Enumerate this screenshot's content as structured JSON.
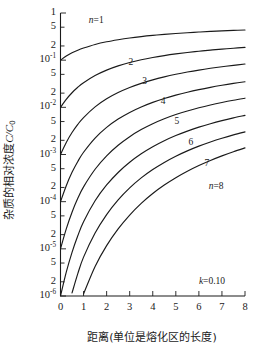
{
  "chart_data": {
    "type": "line",
    "title": "",
    "xlabel": "距离(单位是熔化区的长度)",
    "ylabel": "杂质的相对浓度C/C₀",
    "ylabel_parts": {
      "text": "杂质的相对浓度",
      "italic": "C/C",
      "sub": "0"
    },
    "annotation": {
      "text": "k=0.10",
      "italic": "k",
      "rest": "=0.10"
    },
    "xlim": [
      0,
      8
    ],
    "ylim": [
      1e-06,
      1
    ],
    "yscale": "log",
    "grid": false,
    "legend": "inline-curve-labels",
    "xticks": [
      0,
      1,
      2,
      3,
      4,
      5,
      6,
      7,
      8
    ],
    "xtick_labels": [
      "0",
      "1",
      "2",
      "3",
      "4",
      "5",
      "6",
      "7",
      "8"
    ],
    "ytick_labels": [
      {
        "mant": "1",
        "exp": ""
      },
      {
        "mant": "5",
        "exp": ""
      },
      {
        "mant": "2",
        "exp": ""
      },
      {
        "mant": "10",
        "exp": "-1"
      },
      {
        "mant": "5",
        "exp": ""
      },
      {
        "mant": "2",
        "exp": ""
      },
      {
        "mant": "10",
        "exp": "-2"
      },
      {
        "mant": "5",
        "exp": ""
      },
      {
        "mant": "2",
        "exp": ""
      },
      {
        "mant": "10",
        "exp": "-3"
      },
      {
        "mant": "5",
        "exp": ""
      },
      {
        "mant": "2",
        "exp": ""
      },
      {
        "mant": "10",
        "exp": "-4"
      },
      {
        "mant": "5",
        "exp": ""
      },
      {
        "mant": "2",
        "exp": ""
      },
      {
        "mant": "10",
        "exp": "-5"
      },
      {
        "mant": "5",
        "exp": ""
      },
      {
        "mant": "2",
        "exp": ""
      },
      {
        "mant": "10",
        "exp": "-6"
      }
    ],
    "ytick_values": [
      1,
      0.5,
      0.2,
      0.1,
      0.05,
      0.02,
      0.01,
      0.005,
      0.002,
      0.001,
      0.0005,
      0.0002,
      0.0001,
      5e-05,
      2e-05,
      1e-05,
      5e-06,
      2e-06,
      1e-06
    ],
    "x": [
      0,
      0.25,
      0.5,
      0.75,
      1,
      1.5,
      2,
      2.5,
      3,
      3.5,
      4,
      4.5,
      5,
      5.5,
      6,
      6.5,
      7,
      7.5,
      8
    ],
    "series": [
      {
        "name": "n=1",
        "label": "n=1",
        "label_x": 1.55,
        "label_y": 0.6,
        "values": [
          0.1,
          0.122,
          0.143,
          0.163,
          0.181,
          0.215,
          0.245,
          0.271,
          0.295,
          0.316,
          0.335,
          0.352,
          0.368,
          0.382,
          0.395,
          0.407,
          0.418,
          0.428,
          0.437
        ]
      },
      {
        "name": "n=2",
        "label": "2",
        "label_x": 3.05,
        "label_y": 0.078,
        "values": [
          0.01,
          0.0148,
          0.0204,
          0.0266,
          0.0332,
          0.0472,
          0.0615,
          0.0755,
          0.089,
          0.1018,
          0.1138,
          0.1251,
          0.1357,
          0.1455,
          0.1548,
          0.1634,
          0.1715,
          0.1791,
          0.1862
        ]
      },
      {
        "name": "n=3",
        "label": "3",
        "label_x": 3.65,
        "label_y": 0.0305,
        "values": [
          0.001,
          0.0018,
          0.00292,
          0.00435,
          0.00608,
          0.01025,
          0.01518,
          0.0206,
          0.02634,
          0.03226,
          0.03825,
          0.04424,
          0.05018,
          0.056,
          0.0617,
          0.06724,
          0.0726,
          0.0778,
          0.0828
        ]
      },
      {
        "name": "n=4",
        "label": "4",
        "label_x": 4.45,
        "label_y": 0.0118,
        "values": [
          0.0001,
          0.000218,
          0.000418,
          0.000712,
          0.001115,
          0.00223,
          0.00376,
          0.00564,
          0.0078,
          0.01018,
          0.01273,
          0.0154,
          0.01815,
          0.02094,
          0.02376,
          0.02658,
          0.02938,
          0.03214,
          0.03484
        ]
      },
      {
        "name": "n=5",
        "label": "5",
        "label_x": 5.05,
        "label_y": 0.00445,
        "values": [
          1e-05,
          2.65e-05,
          5.98e-05,
          0.0001175,
          0.000206,
          0.000486,
          0.000935,
          0.00157,
          0.00239,
          0.00337,
          0.00449,
          0.00571,
          0.00702,
          0.00839,
          0.0098,
          0.01124,
          0.0127,
          0.01416,
          0.01562
        ]
      },
      {
        "name": "n=6",
        "label": "6",
        "label_x": 5.65,
        "label_y": 0.00161,
        "values": [
          1e-06,
          3.2e-06,
          8.4e-06,
          1.89e-05,
          3.76e-05,
          0.0001044,
          0.000226,
          0.000416,
          0.000684,
          0.001033,
          0.001458,
          0.001955,
          0.002517,
          0.003135,
          0.0038,
          0.004502,
          0.005232,
          0.005983,
          0.00675
        ]
      },
      {
        "name": "n=7",
        "label": "7",
        "label_x": 6.35,
        "label_y": 0.00056,
        "values": [
          1e-07,
          3.78e-07,
          1.16e-06,
          2.98e-06,
          6.67e-06,
          2.16e-05,
          5.32e-05,
          0.000109,
          0.000196,
          0.000319,
          0.00048,
          0.00068,
          0.00092,
          0.001195,
          0.001505,
          0.001845,
          0.002215,
          0.00261,
          0.003025
        ]
      },
      {
        "name": "n=8",
        "label": "n=8",
        "label_x": 6.75,
        "label_y": 0.000187,
        "values": [
          1e-08,
          4.37e-08,
          1.54e-07,
          4.46e-07,
          1.11e-06,
          4.23e-06,
          1.17e-05,
          2.65e-05,
          5.21e-05,
          9.21e-05,
          0.000149,
          0.000225,
          0.000322,
          0.000441,
          0.000583,
          0.000748,
          0.000936,
          0.001146,
          0.001379
        ]
      }
    ]
  },
  "colors": {
    "ink": "#1a1a1a",
    "background": "#ffffff"
  }
}
